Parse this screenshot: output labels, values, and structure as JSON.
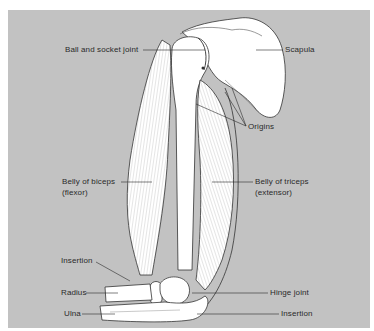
{
  "figure": {
    "type": "anatomical-diagram",
    "background_color": "#c2c2c2",
    "line_color": "#2a2a2a",
    "labels": {
      "ball_and_socket_joint": "Ball and socket joint",
      "scapula": "Scapula",
      "origins": "Origins",
      "belly_of_biceps_line1": "Belly of biceps",
      "belly_of_biceps_line2": "(flexor)",
      "belly_of_triceps_line1": "Belly of triceps",
      "belly_of_triceps_line2": "(extensor)",
      "insertion_biceps": "Insertion",
      "radius": "Radius",
      "hinge_joint": "Hinge joint",
      "ulna": "Ulna",
      "insertion_triceps": "Insertion"
    }
  }
}
